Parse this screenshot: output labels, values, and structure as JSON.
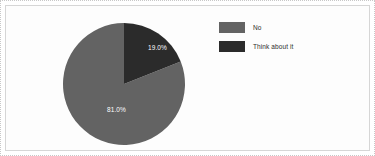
{
  "chart_data": {
    "type": "pie",
    "title": "",
    "categories": [
      "No",
      "Think about it"
    ],
    "values": [
      81.0,
      19.0
    ],
    "labels": [
      "81.0%",
      "19.0%"
    ],
    "colors": [
      "#636363",
      "#2b2b2b"
    ],
    "legend_position": "right",
    "grid": false,
    "start_angle_deg": 0,
    "direction": "clockwise"
  },
  "slices": {
    "light": {
      "name": "No",
      "value": 81.0,
      "label": "81.0%",
      "color": "#636363"
    },
    "dark": {
      "name": "Think about it",
      "value": 19.0,
      "label": "19.0%",
      "color": "#2b2b2b"
    }
  },
  "legend": {
    "items": [
      {
        "label": "No",
        "color": "#636363"
      },
      {
        "label": "Think about it",
        "color": "#2b2b2b"
      }
    ]
  },
  "style": {
    "background": "#ffffff",
    "panel_border": "#d6d6d6",
    "figure_border": "#c8c8c8",
    "label_text_color": "#ffffff",
    "legend_text_color": "#2d2d2d"
  }
}
